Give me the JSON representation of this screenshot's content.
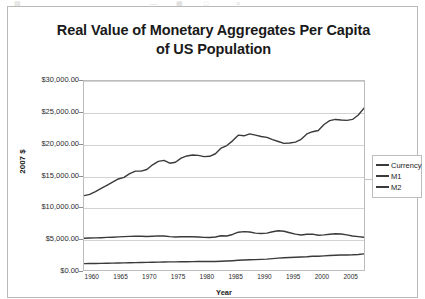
{
  "toolbar": {
    "glyphs": [
      "▤",
      "—",
      "▦",
      "□",
      "≡"
    ]
  },
  "chart_data": {
    "type": "line",
    "title": "Real Value of Monetary Aggregates Per Capita",
    "title_line2": "of US Population",
    "xlabel": "Year",
    "ylabel": "2007 $",
    "grid": true,
    "legend_position": "right",
    "xlim": [
      1959,
      2008
    ],
    "ylim": [
      0,
      30000
    ],
    "y_ticks": [
      0,
      5000,
      10000,
      15000,
      20000,
      25000,
      30000
    ],
    "y_tick_labels": [
      "$0.00",
      "$5,000.00",
      "$10,000.00",
      "$15,000.00",
      "$20,000.00",
      "$25,000.00",
      "$30,000.00"
    ],
    "x_ticks": [
      1960,
      1965,
      1970,
      1975,
      1980,
      1985,
      1990,
      1995,
      2000,
      2005
    ],
    "x_tick_labels": [
      "1960",
      "1965",
      "1970",
      "1975",
      "1980",
      "1985",
      "1990",
      "1995",
      "2000",
      "2005"
    ],
    "colors": {
      "currency": "#3a3a3a",
      "m1": "#3a3a3a",
      "m2": "#3a3a3a",
      "gridline": "#d2d2d2",
      "axis": "#bdbdbd"
    },
    "x": [
      1959,
      1960,
      1961,
      1962,
      1963,
      1964,
      1965,
      1966,
      1967,
      1968,
      1969,
      1970,
      1971,
      1972,
      1973,
      1974,
      1975,
      1976,
      1977,
      1978,
      1979,
      1980,
      1981,
      1982,
      1983,
      1984,
      1985,
      1986,
      1987,
      1988,
      1989,
      1990,
      1991,
      1992,
      1993,
      1994,
      1995,
      1996,
      1997,
      1998,
      1999,
      2000,
      2001,
      2002,
      2003,
      2004,
      2005,
      2006,
      2007,
      2008
    ],
    "series": [
      {
        "name": "Currency",
        "values": [
          1020,
          1030,
          1040,
          1055,
          1070,
          1090,
          1110,
          1130,
          1150,
          1175,
          1195,
          1210,
          1230,
          1255,
          1275,
          1285,
          1290,
          1300,
          1315,
          1335,
          1350,
          1345,
          1340,
          1355,
          1395,
          1430,
          1480,
          1540,
          1580,
          1620,
          1640,
          1680,
          1730,
          1800,
          1880,
          1950,
          1990,
          2030,
          2060,
          2110,
          2180,
          2180,
          2250,
          2300,
          2340,
          2370,
          2390,
          2410,
          2450,
          2560
        ]
      },
      {
        "name": "M1",
        "values": [
          5050,
          5070,
          5100,
          5130,
          5170,
          5210,
          5260,
          5290,
          5330,
          5370,
          5350,
          5320,
          5360,
          5420,
          5400,
          5290,
          5230,
          5270,
          5290,
          5280,
          5240,
          5180,
          5160,
          5230,
          5430,
          5400,
          5640,
          6000,
          6090,
          6030,
          5850,
          5800,
          5860,
          6080,
          6240,
          6150,
          5920,
          5690,
          5560,
          5670,
          5690,
          5510,
          5580,
          5680,
          5760,
          5720,
          5570,
          5400,
          5300,
          5200
        ]
      },
      {
        "name": "M2",
        "values": [
          11800,
          12000,
          12450,
          12950,
          13450,
          13950,
          14450,
          14700,
          15300,
          15700,
          15700,
          15950,
          16700,
          17250,
          17400,
          16950,
          17100,
          17750,
          18100,
          18250,
          18200,
          18000,
          18050,
          18450,
          19350,
          19750,
          20500,
          21400,
          21300,
          21600,
          21400,
          21200,
          21050,
          20700,
          20400,
          20100,
          20150,
          20300,
          20750,
          21600,
          21950,
          22150,
          23100,
          23700,
          23900,
          23800,
          23750,
          23900,
          24600,
          25700
        ]
      }
    ]
  },
  "legend": {
    "items": [
      {
        "label": "Currency"
      },
      {
        "label": "M1"
      },
      {
        "label": "M2"
      }
    ]
  }
}
